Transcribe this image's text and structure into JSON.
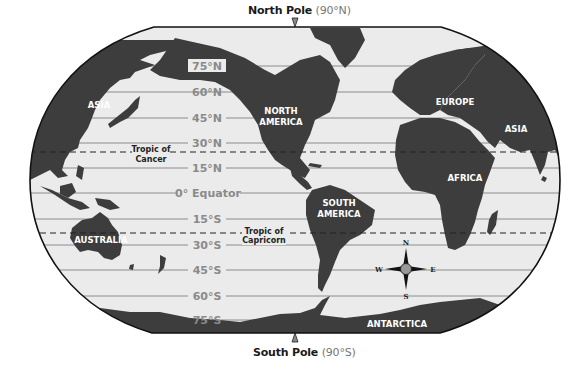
{
  "poles": {
    "north": {
      "label": "North Pole",
      "degree": "(90°N)"
    },
    "south": {
      "label": "South Pole",
      "degree": "(90°S)"
    }
  },
  "latitudes": [
    {
      "label": "75°N",
      "y": 66
    },
    {
      "label": "60°N",
      "y": 92
    },
    {
      "label": "45°N",
      "y": 118
    },
    {
      "label": "30°N",
      "y": 143
    },
    {
      "label": "15°N",
      "y": 168
    },
    {
      "label": "0° Equator",
      "y": 193
    },
    {
      "label": "15°S",
      "y": 219
    },
    {
      "label": "30°S",
      "y": 245
    },
    {
      "label": "45°S",
      "y": 270
    },
    {
      "label": "60°S",
      "y": 296
    },
    {
      "label": "75°S",
      "y": 320
    }
  ],
  "tropics": {
    "cancer": {
      "line1": "Tropic of",
      "line2": "Cancer"
    },
    "capricorn": {
      "line1": "Tropic of",
      "line2": "Capricorn"
    }
  },
  "continents": {
    "asia_west": "ASIA",
    "asia_east": "ASIA",
    "north_america_1": "NORTH",
    "north_america_2": "AMERICA",
    "south_america_1": "SOUTH",
    "south_america_2": "AMERICA",
    "europe": "EUROPE",
    "africa": "AFRICA",
    "australia": "AUSTRALIA",
    "antarctica": "ANTARCTICA"
  },
  "compass": {
    "n": "N",
    "s": "S",
    "e": "E",
    "w": "W"
  },
  "colors": {
    "land": "#3d3d3d",
    "ocean": "#ebebeb",
    "grid": "#8c8c8c",
    "border": "#111111"
  }
}
